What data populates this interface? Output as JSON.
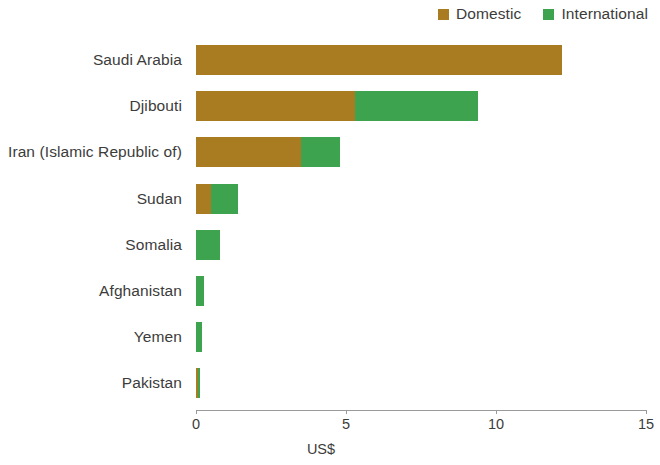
{
  "legend": {
    "position": "top-right",
    "entries": [
      {
        "label": "Domestic",
        "color": "#a97c21",
        "name": "domestic"
      },
      {
        "label": "International",
        "color": "#3ea34e",
        "name": "international"
      }
    ]
  },
  "axis": {
    "x_title": "US$",
    "ticks": [
      "0",
      "5",
      "10",
      "15"
    ],
    "tick_values": [
      0,
      5,
      10,
      15
    ],
    "xmin": 0,
    "xmax": 15
  },
  "chart_data": {
    "type": "bar",
    "orientation": "horizontal",
    "stacked": true,
    "title": "",
    "xlabel": "US$",
    "ylabel": "",
    "xlim": [
      0,
      15
    ],
    "grid": false,
    "legend_position": "top-right",
    "categories": [
      "Saudi Arabia",
      "Djibouti",
      "Iran (Islamic Republic of)",
      "Sudan",
      "Somalia",
      "Afghanistan",
      "Yemen",
      "Pakistan"
    ],
    "series": [
      {
        "name": "Domestic",
        "color": "#a97c21",
        "values": [
          12.2,
          5.3,
          3.5,
          0.5,
          0.0,
          0.0,
          0.0,
          0.08
        ]
      },
      {
        "name": "International",
        "color": "#3ea34e",
        "values": [
          0.0,
          4.1,
          1.3,
          0.9,
          0.8,
          0.25,
          0.2,
          0.07
        ]
      }
    ],
    "totals": [
      12.2,
      9.4,
      4.8,
      1.4,
      0.8,
      0.25,
      0.2,
      0.15
    ]
  }
}
